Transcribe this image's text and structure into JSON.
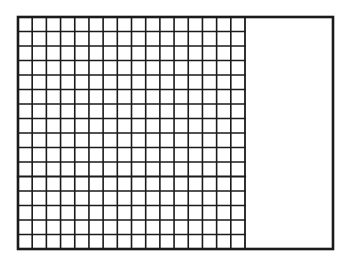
{
  "diagram": {
    "type": "grid-model",
    "outer_rect": {
      "x": 18,
      "y": 17,
      "width": 315,
      "height": 232
    },
    "grid": {
      "x": 18,
      "y": 17,
      "width": 227,
      "height": 232,
      "columns": 16,
      "rows": 16,
      "emphasized_row_line": 11
    },
    "colors": {
      "stroke": "#1a1a1a",
      "background": "#ffffff"
    }
  }
}
